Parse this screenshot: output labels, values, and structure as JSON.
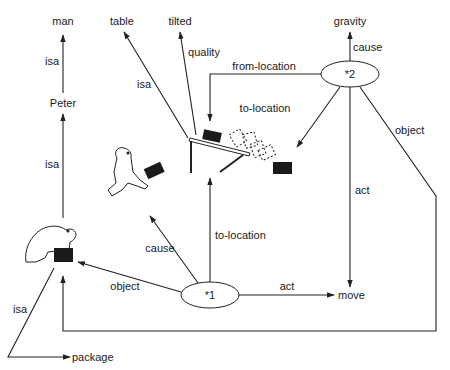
{
  "diagram": {
    "type": "semantic-network",
    "nodes": {
      "man": "man",
      "peter": "Peter",
      "table": "table",
      "tilted": "tilted",
      "gravity": "gravity",
      "event2": "*2",
      "event1": "*1",
      "move": "move",
      "package": "package"
    },
    "edges": {
      "peter_isa_man": "isa",
      "bear_isa_peter": "isa",
      "table_isa": "isa",
      "table_quality": "quality",
      "e2_cause": "cause",
      "e2_from_location": "from-location",
      "e2_to_location": "to-location",
      "e2_object": "object",
      "e2_act": "act",
      "e1_cause": "cause",
      "e1_to_location": "to-location",
      "e1_object": "object",
      "e1_act": "act",
      "package_isa": "isa"
    },
    "illustrations": [
      "bear-holding-package",
      "jumping-bear-with-package",
      "tilted-table-with-falling-package"
    ]
  }
}
